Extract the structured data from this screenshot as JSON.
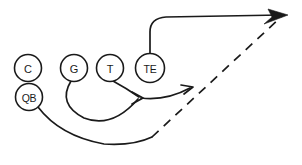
{
  "diagram": {
    "type": "american-football-play-schematic",
    "background_color": "#ffffff",
    "line_color": "#1a1a1a",
    "width": 302,
    "height": 165,
    "players": [
      {
        "id": "center",
        "label": "C",
        "name": "center-player-marker",
        "cx": 28,
        "cy": 68,
        "r": 13.5,
        "has_route": false
      },
      {
        "id": "guard",
        "label": "G",
        "name": "guard-player-marker",
        "cx": 74,
        "cy": 68,
        "r": 13.5,
        "has_route": true
      },
      {
        "id": "tackle",
        "label": "T",
        "name": "tackle-player-marker",
        "cx": 110,
        "cy": 68,
        "r": 13.5,
        "has_route": true
      },
      {
        "id": "tight-end",
        "label": "TE",
        "name": "tight-end-player-marker",
        "cx": 150,
        "cy": 68,
        "r": 14.5,
        "has_route": true
      },
      {
        "id": "quarterback",
        "label": "QB",
        "name": "quarterback-player-marker",
        "cx": 29,
        "cy": 97,
        "r": 13.5,
        "has_route": true
      }
    ],
    "routes": [
      {
        "id": "tight-end-route",
        "name": "tight-end-route-path",
        "style": "solid",
        "from": "tight-end",
        "description": "vertical release then break right to deep target",
        "path": "M 150 53.5 L 150 32 Q 150 18 166 17 L 281 15"
      },
      {
        "id": "guard-pull-route",
        "name": "guard-pull-route-path",
        "style": "solid",
        "from": "guard",
        "description": "guard pulls down and right to block point",
        "path": "M 71 81 Q 57 104 84 118 Q 112 129 138 99"
      },
      {
        "id": "tackle-block-route",
        "name": "tackle-block-route-path",
        "style": "solid",
        "from": "tackle",
        "description": "tackle blocks down and right to block point",
        "path": "M 113 81 Q 126 88 139 97"
      },
      {
        "id": "block-point-continuation-route",
        "name": "block-point-continuation-route-path",
        "style": "solid",
        "from": "block-point",
        "description": "curve from block point out to the right",
        "path": "M 141 98 Q 166 101 190 88"
      },
      {
        "id": "quarterback-route",
        "name": "quarterback-route-path",
        "style": "solid",
        "from": "quarterback",
        "description": "quarterback sweeps wide right along the ground",
        "path": "M 38 107 Q 60 136 104 144 Q 133 146 152 137"
      },
      {
        "id": "ball-flight-path",
        "name": "ball-flight-dashed-path",
        "style": "dashed",
        "from": "quarterback-route-end",
        "description": "dashed pass trajectory to deep target",
        "path": "M 152 137 L 281 17"
      }
    ],
    "arrows": [
      {
        "id": "deep-target-arrow",
        "name": "deep-target-arrowhead",
        "type": "filled",
        "x": 288,
        "y": 15,
        "points": "288,15 268,9 272,17 264,24"
      },
      {
        "id": "block-point-arrow",
        "name": "block-point-arrowhead",
        "type": "open",
        "x": 141,
        "y": 98,
        "points": "132,92 143,98 132,104"
      },
      {
        "id": "right-curve-arrow",
        "name": "right-curve-arrowhead",
        "type": "open",
        "x": 192,
        "y": 87,
        "points": "181,85 193,87 184,94"
      }
    ]
  }
}
